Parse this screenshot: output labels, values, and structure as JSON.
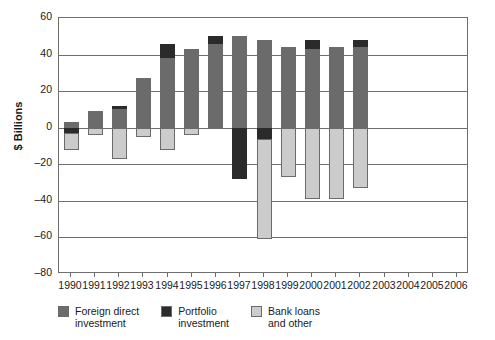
{
  "chart_data": {
    "type": "bar",
    "subtype": "stacked-bar-with-negative-values",
    "title": "",
    "xlabel": "",
    "ylabel": "$ Billions",
    "ylim": [
      -80,
      60
    ],
    "ytick_values": [
      60,
      40,
      20,
      0,
      -20,
      -40,
      -60,
      -80
    ],
    "ytick_labels": [
      "60",
      "40",
      "20",
      "0",
      "–20",
      "–40",
      "–60",
      "–80"
    ],
    "grid": true,
    "legend_position": "bottom-left",
    "categories": [
      "1990",
      "1991",
      "1992",
      "1993",
      "1994",
      "1995",
      "1996",
      "1997",
      "1998",
      "1999",
      "2000",
      "2001",
      "2002",
      "2003",
      "2004",
      "2005",
      "2006"
    ],
    "series": [
      {
        "name": "Foreign direct investment",
        "color": "#6b6b6b",
        "values": [
          3,
          9,
          10,
          27,
          38,
          43,
          46,
          50,
          48,
          44,
          43,
          44,
          44,
          null,
          null,
          null,
          null
        ]
      },
      {
        "name": "Portfolio investment",
        "color": "#2b2b2b",
        "values": [
          -3,
          0,
          2,
          0,
          8,
          0,
          4,
          -28,
          -6,
          1,
          5,
          0,
          4,
          null,
          null,
          null,
          null
        ]
      },
      {
        "name": "Bank loans and other",
        "color": "#cccccc",
        "values": [
          -9,
          -4,
          -17,
          -5,
          -12,
          -4,
          0,
          0,
          -55,
          -27,
          -39,
          -39,
          -33,
          null,
          null,
          null,
          null
        ]
      }
    ],
    "bars": [
      {
        "year": "1990",
        "fdi_top": 3,
        "fdi_bottom": 0,
        "portfolio_top": 0,
        "portfolio_bottom": -3,
        "bank_top": -3,
        "bank_bottom": -12
      },
      {
        "year": "1991",
        "fdi_top": 9,
        "fdi_bottom": 0,
        "portfolio_top": 0,
        "portfolio_bottom": 0,
        "bank_top": 0,
        "bank_bottom": -4
      },
      {
        "year": "1992",
        "fdi_top": 10,
        "fdi_bottom": 0,
        "portfolio_top": 12,
        "portfolio_bottom": 10,
        "bank_top": 0,
        "bank_bottom": -17
      },
      {
        "year": "1993",
        "fdi_top": 27,
        "fdi_bottom": 0,
        "portfolio_top": 0,
        "portfolio_bottom": 0,
        "bank_top": 0,
        "bank_bottom": -5
      },
      {
        "year": "1994",
        "fdi_top": 38,
        "fdi_bottom": 0,
        "portfolio_top": 46,
        "portfolio_bottom": 38,
        "bank_top": 0,
        "bank_bottom": -12
      },
      {
        "year": "1995",
        "fdi_top": 43,
        "fdi_bottom": 0,
        "portfolio_top": 0,
        "portfolio_bottom": 0,
        "bank_top": 0,
        "bank_bottom": -4
      },
      {
        "year": "1996",
        "fdi_top": 46,
        "fdi_bottom": 0,
        "portfolio_top": 50,
        "portfolio_bottom": 46,
        "bank_top": 0,
        "bank_bottom": 0
      },
      {
        "year": "1997",
        "fdi_top": 50,
        "fdi_bottom": 0,
        "portfolio_top": 0,
        "portfolio_bottom": -28,
        "bank_top": 0,
        "bank_bottom": 0
      },
      {
        "year": "1998",
        "fdi_top": 48,
        "fdi_bottom": 0,
        "portfolio_top": 0,
        "portfolio_bottom": -6,
        "bank_top": -6,
        "bank_bottom": -61
      },
      {
        "year": "1999",
        "fdi_top": 44,
        "fdi_bottom": 0,
        "portfolio_top": 0,
        "portfolio_bottom": 0,
        "bank_top": 0,
        "bank_bottom": -27
      },
      {
        "year": "2000",
        "fdi_top": 43,
        "fdi_bottom": 0,
        "portfolio_top": 48,
        "portfolio_bottom": 43,
        "bank_top": 0,
        "bank_bottom": -39
      },
      {
        "year": "2001",
        "fdi_top": 44,
        "fdi_bottom": 0,
        "portfolio_top": 0,
        "portfolio_bottom": 0,
        "bank_top": 0,
        "bank_bottom": -39
      },
      {
        "year": "2002",
        "fdi_top": 44,
        "fdi_bottom": 0,
        "portfolio_top": 48,
        "portfolio_bottom": 44,
        "bank_top": 0,
        "bank_bottom": -33
      }
    ]
  },
  "axis": {
    "y_title": "$ Billions"
  },
  "legend": {
    "items": [
      {
        "label": "Foreign direct\ninvestment",
        "color": "#6b6b6b"
      },
      {
        "label": "Portfolio\ninvestment",
        "color": "#2b2b2b"
      },
      {
        "label": "Bank loans\nand other",
        "color": "#cccccc"
      }
    ]
  }
}
